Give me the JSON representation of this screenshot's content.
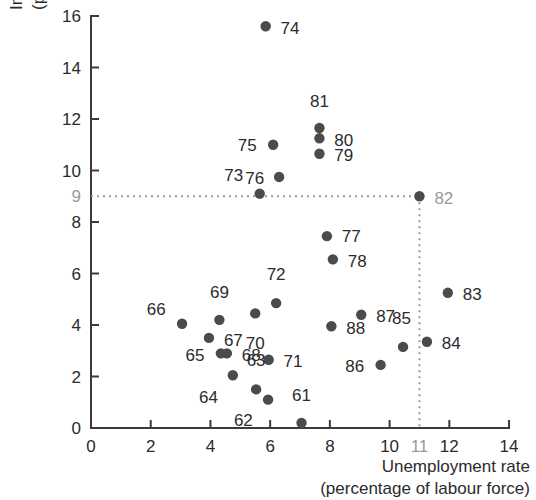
{
  "chart_data": {
    "type": "scatter",
    "title": "",
    "xlabel": "Unemployment rate (percentage of labour force)",
    "xlabel_line1": "Unemployment rate",
    "xlabel_line2": "(percentage of labour force)",
    "ylabel": "Inflation rate (percent per year)",
    "ylabel_line1": "Inflation rate",
    "ylabel_line2": "(percent per year)",
    "xlim": [
      0,
      14
    ],
    "ylim": [
      0,
      16
    ],
    "xticks": [
      0,
      2,
      4,
      6,
      8,
      10,
      12,
      14
    ],
    "xtick_labels": [
      "0",
      "2",
      "4",
      "6",
      "8",
      "10",
      "12",
      "14"
    ],
    "yticks": [
      0,
      2,
      4,
      6,
      8,
      10,
      12,
      14,
      16
    ],
    "ytick_labels": [
      "0",
      "2",
      "4",
      "6",
      "8",
      "10",
      "12",
      "14",
      "16"
    ],
    "extra_xtick": {
      "value": 11,
      "label": "11",
      "color": "#9a9a9a"
    },
    "extra_ytick": {
      "value": 9,
      "label": "9",
      "color": "#9a9a9a"
    },
    "grid": false,
    "legend": false,
    "marker_color": "#4b4b4b",
    "guide_color": "#9a9a9a",
    "guides": {
      "horizontal_y": 9,
      "vertical_x": 11,
      "style": "dotted"
    },
    "point_labels_are_years": true,
    "points": [
      {
        "label": "61",
        "x": 7.05,
        "y": 0.2,
        "lx": 7.05,
        "ly": 1.05,
        "anchor": "above",
        "muted": false
      },
      {
        "label": "62",
        "x": 5.93,
        "y": 1.1,
        "lx": 5.42,
        "ly": 0.55,
        "anchor": "left-below",
        "muted": false
      },
      {
        "label": "63",
        "x": 5.53,
        "y": 1.5,
        "lx": 5.53,
        "ly": 2.4,
        "anchor": "above",
        "muted": false
      },
      {
        "label": "64",
        "x": 4.75,
        "y": 2.05,
        "lx": 4.25,
        "ly": 1.45,
        "anchor": "left-below",
        "muted": false
      },
      {
        "label": "65",
        "x": 4.35,
        "y": 2.9,
        "lx": 3.8,
        "ly": 2.85,
        "anchor": "left",
        "muted": false
      },
      {
        "label": "66",
        "x": 3.05,
        "y": 4.05,
        "lx": 2.5,
        "ly": 4.4,
        "anchor": "left-above",
        "muted": false
      },
      {
        "label": "67",
        "x": 3.95,
        "y": 3.5,
        "lx": 4.45,
        "ly": 3.4,
        "anchor": "right",
        "muted": false
      },
      {
        "label": "68",
        "x": 4.55,
        "y": 2.9,
        "lx": 5.05,
        "ly": 2.85,
        "anchor": "right",
        "muted": false
      },
      {
        "label": "69",
        "x": 4.3,
        "y": 4.2,
        "lx": 4.3,
        "ly": 5.05,
        "anchor": "above",
        "muted": false
      },
      {
        "label": "70",
        "x": 5.5,
        "y": 4.45,
        "lx": 5.5,
        "ly": 3.55,
        "anchor": "below",
        "muted": false
      },
      {
        "label": "71",
        "x": 5.95,
        "y": 2.65,
        "lx": 6.45,
        "ly": 2.6,
        "anchor": "right",
        "muted": false
      },
      {
        "label": "72",
        "x": 6.2,
        "y": 4.85,
        "lx": 6.2,
        "ly": 5.75,
        "anchor": "above",
        "muted": false
      },
      {
        "label": "73",
        "x": 5.65,
        "y": 9.1,
        "lx": 5.1,
        "ly": 9.6,
        "anchor": "left-above",
        "muted": false
      },
      {
        "label": "74",
        "x": 5.85,
        "y": 15.6,
        "lx": 6.35,
        "ly": 15.55,
        "anchor": "right",
        "muted": false
      },
      {
        "label": "75",
        "x": 6.1,
        "y": 11.0,
        "lx": 5.55,
        "ly": 11.0,
        "anchor": "left",
        "muted": false
      },
      {
        "label": "76",
        "x": 6.3,
        "y": 9.75,
        "lx": 5.8,
        "ly": 9.7,
        "anchor": "left",
        "muted": false
      },
      {
        "label": "77",
        "x": 7.9,
        "y": 7.45,
        "lx": 8.4,
        "ly": 7.45,
        "anchor": "right",
        "muted": false
      },
      {
        "label": "78",
        "x": 8.1,
        "y": 6.55,
        "lx": 8.6,
        "ly": 6.5,
        "anchor": "right",
        "muted": false
      },
      {
        "label": "79",
        "x": 7.65,
        "y": 10.65,
        "lx": 8.15,
        "ly": 10.6,
        "anchor": "right",
        "muted": false
      },
      {
        "label": "80",
        "x": 7.65,
        "y": 11.25,
        "lx": 8.15,
        "ly": 11.2,
        "anchor": "right",
        "muted": false
      },
      {
        "label": "81",
        "x": 7.65,
        "y": 11.65,
        "lx": 7.65,
        "ly": 12.45,
        "anchor": "above",
        "muted": false
      },
      {
        "label": "82",
        "x": 11.0,
        "y": 9.0,
        "lx": 11.5,
        "ly": 8.95,
        "anchor": "right",
        "muted": true
      },
      {
        "label": "83",
        "x": 11.95,
        "y": 5.25,
        "lx": 12.45,
        "ly": 5.2,
        "anchor": "right",
        "muted": false
      },
      {
        "label": "84",
        "x": 11.25,
        "y": 3.35,
        "lx": 11.75,
        "ly": 3.3,
        "anchor": "right",
        "muted": false
      },
      {
        "label": "85",
        "x": 10.45,
        "y": 3.15,
        "lx": 10.4,
        "ly": 4.05,
        "anchor": "above",
        "muted": false
      },
      {
        "label": "86",
        "x": 9.7,
        "y": 2.45,
        "lx": 9.15,
        "ly": 2.4,
        "anchor": "left",
        "muted": false
      },
      {
        "label": "87",
        "x": 9.05,
        "y": 4.4,
        "lx": 9.55,
        "ly": 4.35,
        "anchor": "right",
        "muted": false
      },
      {
        "label": "88",
        "x": 8.05,
        "y": 3.95,
        "lx": 8.55,
        "ly": 3.9,
        "anchor": "right",
        "muted": false
      }
    ]
  },
  "geometry": {
    "origin_x_px": 91,
    "origin_y_px": 428,
    "x_unit_px": 29.86,
    "y_unit_px": 25.75,
    "dot_radius_px": 5.2
  }
}
